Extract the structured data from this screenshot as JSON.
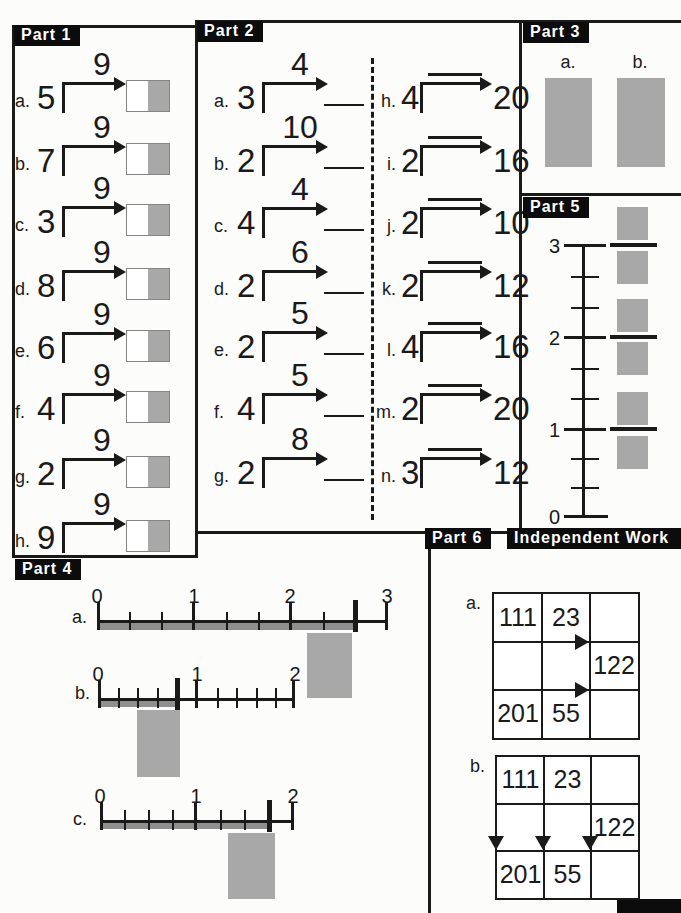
{
  "colors": {
    "ink": "#1a1a1a",
    "gray_fill": "#a8a8a8",
    "strip_gray": "#8f8f8f",
    "paper": "#fcfcfb"
  },
  "part1": {
    "label": "Part 1",
    "arrow_label": "9",
    "items": [
      {
        "letter": "a.",
        "value": "5"
      },
      {
        "letter": "b.",
        "value": "7"
      },
      {
        "letter": "c.",
        "value": "3"
      },
      {
        "letter": "d.",
        "value": "8"
      },
      {
        "letter": "e.",
        "value": "6"
      },
      {
        "letter": "f.",
        "value": "4"
      },
      {
        "letter": "g.",
        "value": "2"
      },
      {
        "letter": "h.",
        "value": "9"
      }
    ]
  },
  "part2": {
    "label": "Part 2",
    "left_items": [
      {
        "letter": "a.",
        "value": "3",
        "multiplier": "4"
      },
      {
        "letter": "b.",
        "value": "2",
        "multiplier": "10"
      },
      {
        "letter": "c.",
        "value": "4",
        "multiplier": "4"
      },
      {
        "letter": "d.",
        "value": "2",
        "multiplier": "6"
      },
      {
        "letter": "e.",
        "value": "2",
        "multiplier": "5"
      },
      {
        "letter": "f.",
        "value": "4",
        "multiplier": "5"
      },
      {
        "letter": "g.",
        "value": "2",
        "multiplier": "8"
      }
    ],
    "right_items": [
      {
        "letter": "h.",
        "value": "4",
        "product": "20"
      },
      {
        "letter": "i.",
        "value": "2",
        "product": "16"
      },
      {
        "letter": "j.",
        "value": "2",
        "product": "10"
      },
      {
        "letter": "k.",
        "value": "2",
        "product": "12"
      },
      {
        "letter": "l.",
        "value": "4",
        "product": "16"
      },
      {
        "letter": "m.",
        "value": "2",
        "product": "20"
      },
      {
        "letter": "n.",
        "value": "3",
        "product": "12"
      }
    ]
  },
  "part3": {
    "label": "Part 3",
    "items": [
      {
        "letter": "a."
      },
      {
        "letter": "b."
      }
    ]
  },
  "part4": {
    "label": "Part 4",
    "lines": [
      {
        "letter": "a.",
        "tick_labels": [
          "0",
          "1",
          "2",
          "3"
        ],
        "range": [
          0,
          3
        ],
        "divisions_per_unit": 3,
        "shaded_from": "0",
        "shaded_to": "2 2/3"
      },
      {
        "letter": "b.",
        "tick_labels": [
          "0",
          "1",
          "2"
        ],
        "range": [
          0,
          2
        ],
        "divisions_per_unit": 5,
        "shaded_from": "0",
        "shaded_to": "4/5"
      },
      {
        "letter": "c.",
        "tick_labels": [
          "0",
          "1",
          "2"
        ],
        "range": [
          0,
          2
        ],
        "divisions_per_unit": 4,
        "shaded_from": "0",
        "shaded_to": "1 3/4"
      }
    ]
  },
  "part5": {
    "label": "Part 5",
    "tick_labels": [
      "3",
      "2",
      "1",
      "0"
    ],
    "range": [
      0,
      3
    ],
    "divisions_per_unit": 3
  },
  "part6": {
    "label": "Part 6",
    "grids": [
      {
        "letter": "a.",
        "arrow_direction": "right",
        "cells": [
          [
            "111",
            "23",
            ""
          ],
          [
            "",
            "",
            "122"
          ],
          [
            "201",
            "55",
            ""
          ]
        ]
      },
      {
        "letter": "b.",
        "arrow_direction": "down",
        "cells": [
          [
            "111",
            "23",
            ""
          ],
          [
            "",
            "",
            "122"
          ],
          [
            "201",
            "55",
            ""
          ]
        ]
      }
    ]
  },
  "independent_work": {
    "label": "Independent Work"
  }
}
